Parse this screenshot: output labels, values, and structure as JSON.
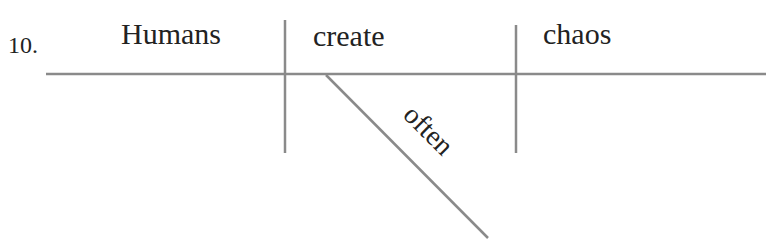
{
  "exercise": {
    "number": "10.",
    "sentence_words": {
      "subject": "Humans",
      "verb": "create",
      "object": "chaos",
      "modifier": "often"
    }
  },
  "colors": {
    "line": "#8a8a8a",
    "text": "#222222"
  }
}
